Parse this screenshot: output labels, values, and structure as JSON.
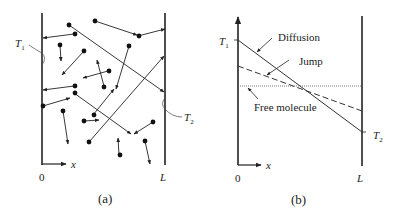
{
  "figure": {
    "panel_a": {
      "caption": "(a)",
      "left_wall_label": "T",
      "left_wall_label_sub": "1",
      "right_wall_label": "T",
      "right_wall_label_sub": "2",
      "axis_label": "x",
      "origin_label": "0",
      "end_label": "L",
      "description": "Gas molecules (dots) moving between two walls at temperatures T1 and T2, with arrows showing trajectories and collisions"
    },
    "panel_b": {
      "caption": "(b)",
      "y_label_top": "T",
      "y_label_top_sub": "1",
      "y_label_bottom": "T",
      "y_label_bottom_sub": "2",
      "axis_label": "x",
      "origin_label": "0",
      "end_label": "L",
      "curves": [
        {
          "name": "Diffusion",
          "style": "solid",
          "start_level": "T1",
          "end_level": "T2"
        },
        {
          "name": "Jump",
          "style": "dashed"
        },
        {
          "name": "Free molecule",
          "style": "dotted"
        }
      ]
    }
  }
}
